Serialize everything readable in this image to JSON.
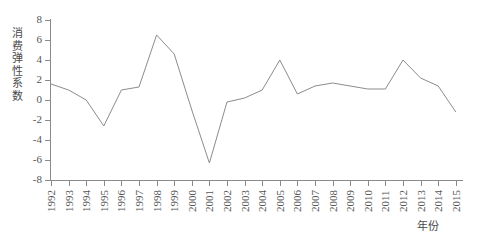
{
  "chart_data": {
    "type": "line",
    "title": "",
    "xlabel": "年份",
    "ylabel": "消费弹性系数",
    "ylim": [
      -8,
      8
    ],
    "yticks": [
      8,
      6,
      4,
      2,
      0,
      -2,
      -4,
      -6,
      -8
    ],
    "ytick_labels": [
      "8",
      "6",
      "4",
      "2",
      "0",
      "-2",
      "-4",
      "-6",
      "-8"
    ],
    "grid": false,
    "legend": "none",
    "line_color": "#8c8c8c",
    "categories": [
      "1992",
      "1993",
      "1994",
      "1995",
      "1996",
      "1997",
      "1998",
      "1999",
      "2000",
      "2001",
      "2002",
      "2003",
      "2004",
      "2005",
      "2006",
      "2007",
      "2008",
      "2009",
      "2010",
      "2011",
      "2012",
      "2013",
      "2014",
      "2015"
    ],
    "values": [
      1.6,
      1.0,
      0.0,
      -2.6,
      1.0,
      1.3,
      6.5,
      4.6,
      -1.0,
      -6.3,
      -0.2,
      0.2,
      1.0,
      4.0,
      0.6,
      1.4,
      1.7,
      1.4,
      1.1,
      1.1,
      4.0,
      2.2,
      1.4,
      -1.2
    ],
    "series_name": "消费弹性系数"
  },
  "axes": {
    "y_title_chars": [
      "消",
      "费",
      "弹",
      "性",
      "系",
      "数"
    ],
    "x_title": "年份"
  }
}
